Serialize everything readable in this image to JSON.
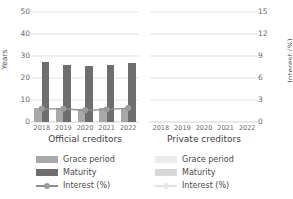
{
  "chart_data": {
    "type": "bar",
    "title": "",
    "subtitle": "",
    "panels": [
      {
        "name": "official",
        "title": "Official creditors",
        "categories": [
          "2018",
          "2019",
          "2020",
          "2021",
          "2022"
        ],
        "series": [
          {
            "name": "Grace period",
            "axis": "left",
            "values": [
              6.5,
              6.3,
              5.8,
              6.2,
              6.6
            ]
          },
          {
            "name": "Maturity",
            "axis": "left",
            "values": [
              27.3,
              25.8,
              25.5,
              25.9,
              26.8
            ]
          },
          {
            "name": "Interest (%)",
            "axis": "right",
            "values": [
              1.8,
              1.8,
              1.6,
              1.7,
              1.9
            ]
          }
        ],
        "has_data": true
      },
      {
        "name": "private",
        "title": "Private creditors",
        "categories": [
          "2018",
          "2019",
          "2020",
          "2021",
          "2022"
        ],
        "series": [
          {
            "name": "Grace period",
            "axis": "left",
            "values": [
              null,
              null,
              null,
              null,
              null
            ]
          },
          {
            "name": "Maturity",
            "axis": "left",
            "values": [
              null,
              null,
              null,
              null,
              null
            ]
          },
          {
            "name": "Interest (%)",
            "axis": "right",
            "values": [
              null,
              null,
              null,
              null,
              null
            ]
          }
        ],
        "has_data": false
      }
    ],
    "left_axis": {
      "label": "Years",
      "ticks": [
        0,
        10,
        20,
        30,
        40,
        50
      ],
      "ylim": [
        0,
        52
      ]
    },
    "right_axis": {
      "label": "Interest (%)",
      "ticks": [
        0,
        3,
        6,
        9,
        12,
        15
      ],
      "ylim": [
        0,
        15.6
      ]
    },
    "grid": true,
    "legend_position": "bottom",
    "legend_entries": [
      "Grace period",
      "Maturity",
      "Interest (%)"
    ],
    "colors": {
      "grace_period": "#a9a9a9",
      "maturity": "#6e6e6e",
      "interest_line": "#8d8d8d",
      "grid": "#e4e4e4",
      "faded_grace": "#ececec",
      "faded_maturity": "#d8d8d8",
      "faded_line": "#e2e2e2"
    }
  }
}
